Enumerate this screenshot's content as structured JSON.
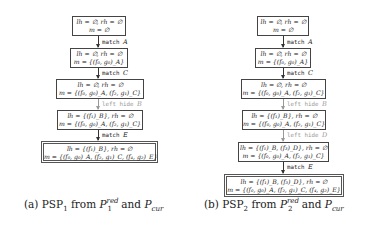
{
  "panels": [
    {
      "id": "a",
      "caption": {
        "prefix": "(a) PSP",
        "sub": "1",
        "from": " from ",
        "p": "P",
        "p_sup": "red",
        "p_sub": "1",
        "and": " and ",
        "pcur": "P",
        "pcur_sub": "cur"
      },
      "states": [
        {
          "line1": "lh = ∅, rh = ∅",
          "line2": "m = ∅"
        },
        {
          "line1": "lh = ∅, rh = ∅",
          "line2": "m = {(f₀, g₀)_A}"
        },
        {
          "line1": "lh = ∅, rh = ∅",
          "line2": "m = {(f₀, g₀)_A, (f₂, g₁)_C}"
        },
        {
          "line1": "lh = {(f₁)_B}, rh = ∅",
          "line2": "m = {(f₀, g₀)_A, (f₂, g₁)_C}"
        },
        {
          "line1": "lh = {(f₁)_B}, rh = ∅",
          "line2": "m = {(f₀, g₀)_A, (f₂, g₁)_C, (f₄, g₂)_E}"
        }
      ],
      "transitions": [
        {
          "op": "match",
          "node": "A",
          "style": "black"
        },
        {
          "op": "match",
          "node": "C",
          "style": "black"
        },
        {
          "op": "left hide",
          "node": "B",
          "style": "gray"
        },
        {
          "op": "match",
          "node": "E",
          "style": "black"
        }
      ]
    },
    {
      "id": "b",
      "caption": {
        "prefix": "(b) PSP",
        "sub": "2",
        "from": " from ",
        "p": "P",
        "p_sup": "red",
        "p_sub": "2",
        "and": " and ",
        "pcur": "P",
        "pcur_sub": "cur"
      },
      "states": [
        {
          "line1": "lh = ∅, rh = ∅",
          "line2": "m = ∅"
        },
        {
          "line1": "lh = ∅, rh = ∅",
          "line2": "m = {(f₀, g₀)_A}"
        },
        {
          "line1": "lh = ∅, rh = ∅",
          "line2": "m = {(f₀, g₀)_A, (f₂, g₁)_C}"
        },
        {
          "line1": "lh = {(f₁)_B}, rh = ∅",
          "line2": "m = {(f₀, g₀)_A, (f₂, g₁)_C}"
        },
        {
          "line1": "lh = {(f₁)_B, (f₃)_D}, rh = ∅",
          "line2": "m = {(f₀, g₀)_A, (f₂, g₁)_C}"
        },
        {
          "line1": "lh = {(f₁)_B, (f₃)_D}, rh = ∅",
          "line2": "m = {(f₀, g₀)_A, (f₂, g₁)_C, (f₄, g₂)_E}"
        }
      ],
      "transitions": [
        {
          "op": "match",
          "node": "A",
          "style": "black"
        },
        {
          "op": "match",
          "node": "C",
          "style": "black"
        },
        {
          "op": "left hide",
          "node": "B",
          "style": "gray"
        },
        {
          "op": "left hide",
          "node": "D",
          "style": "gray"
        },
        {
          "op": "match",
          "node": "E",
          "style": "black"
        }
      ]
    }
  ]
}
